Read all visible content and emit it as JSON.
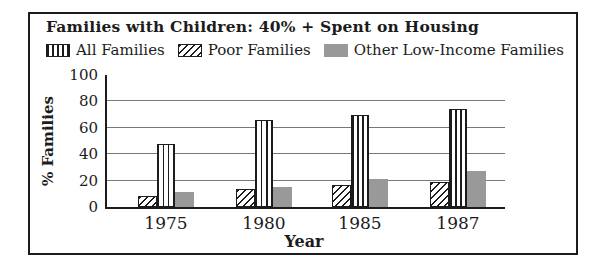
{
  "panel": {
    "title": "Families with Children: 40% + Spent on Housing"
  },
  "legend": {
    "items": [
      {
        "label": "All Families",
        "pattern": "vertical-stripes"
      },
      {
        "label": "Poor Families",
        "pattern": "diagonal-stripes"
      },
      {
        "label": "Other Low-Income Families",
        "pattern": "solid-gray"
      }
    ]
  },
  "chart_data": {
    "type": "bar",
    "title": "Families with Children: 40% + Spent on Housing",
    "categories": [
      "1975",
      "1980",
      "1985",
      "1987"
    ],
    "series": [
      {
        "name": "Poor Families",
        "pattern": "diagonal-stripes",
        "values": [
          8,
          14,
          17,
          19
        ]
      },
      {
        "name": "All Families",
        "pattern": "vertical-stripes",
        "values": [
          48,
          66,
          70,
          74
        ]
      },
      {
        "name": "Other Low-Income Families",
        "pattern": "solid-gray",
        "values": [
          11,
          15,
          21,
          27
        ]
      }
    ],
    "xlabel": "Year",
    "ylabel": "% Families",
    "ylim": [
      0,
      100
    ],
    "yticks": [
      0,
      20,
      40,
      60,
      80,
      100
    ],
    "grid": true,
    "legend_position": "top",
    "colors": {
      "solid_gray_fill": "#999999",
      "outline": "#1c1c1c",
      "grid": "#787878"
    }
  }
}
